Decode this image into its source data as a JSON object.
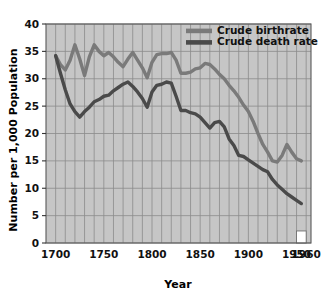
{
  "chart_data": {
    "type": "line",
    "title": "",
    "xlabel": "Year",
    "ylabel": "Number per 1,000 Population",
    "xlim": [
      1690,
      1965
    ],
    "ylim": [
      0,
      40
    ],
    "xticks": [
      1700,
      1750,
      1800,
      1850,
      1900,
      1950,
      1960
    ],
    "xtick_labels": [
      "1700",
      "1750",
      "1800",
      "1850",
      "1900",
      "1950",
      "1960"
    ],
    "yticks": [
      0,
      5,
      10,
      15,
      20,
      25,
      30,
      35,
      40
    ],
    "ytick_labels": [
      "0",
      "5",
      "10",
      "15",
      "20",
      "25",
      "30",
      "35",
      "40"
    ],
    "grid": true,
    "grid_x_step": 10,
    "grid_y_step": 5,
    "legend_position": "top-right",
    "plot_background": "#c6c6c6",
    "grid_color": "#8c8c8c",
    "series": [
      {
        "name": "Crude birthrate",
        "color": "#7a7a7a",
        "x": [
          1700,
          1705,
          1710,
          1715,
          1720,
          1725,
          1730,
          1735,
          1740,
          1745,
          1750,
          1755,
          1760,
          1765,
          1770,
          1775,
          1780,
          1785,
          1790,
          1795,
          1800,
          1805,
          1810,
          1815,
          1820,
          1825,
          1830,
          1835,
          1840,
          1845,
          1850,
          1855,
          1860,
          1865,
          1870,
          1875,
          1880,
          1885,
          1890,
          1895,
          1900,
          1905,
          1910,
          1915,
          1920,
          1925,
          1930,
          1935,
          1940,
          1945,
          1950,
          1955
        ],
        "values": [
          34.2,
          32.6,
          31.6,
          33.4,
          36.2,
          33.6,
          30.6,
          34.0,
          36.2,
          35.0,
          34.2,
          34.8,
          34.0,
          33.0,
          32.2,
          33.6,
          34.8,
          33.4,
          32.0,
          30.2,
          33.0,
          34.4,
          34.6,
          34.6,
          34.8,
          33.4,
          31.0,
          31.0,
          31.2,
          31.8,
          32.0,
          32.8,
          32.6,
          31.8,
          30.8,
          30.0,
          28.8,
          27.8,
          26.6,
          25.2,
          24.0,
          22.2,
          20.0,
          18.0,
          16.6,
          15.0,
          14.8,
          16.0,
          18.0,
          16.6,
          15.4,
          15.0
        ]
      },
      {
        "name": "Crude death rate",
        "color": "#4a4a4a",
        "x": [
          1700,
          1705,
          1710,
          1715,
          1720,
          1725,
          1730,
          1735,
          1740,
          1745,
          1750,
          1755,
          1760,
          1765,
          1770,
          1775,
          1780,
          1785,
          1790,
          1795,
          1800,
          1805,
          1810,
          1815,
          1820,
          1825,
          1830,
          1835,
          1840,
          1845,
          1850,
          1855,
          1860,
          1865,
          1870,
          1875,
          1880,
          1885,
          1890,
          1895,
          1900,
          1905,
          1910,
          1915,
          1920,
          1925,
          1930,
          1935,
          1940,
          1945,
          1950,
          1955
        ],
        "values": [
          34.2,
          31.0,
          28.0,
          25.4,
          24.0,
          23.0,
          24.0,
          24.8,
          25.8,
          26.2,
          26.8,
          27.0,
          27.8,
          28.4,
          29.0,
          29.4,
          28.6,
          27.6,
          26.4,
          24.8,
          27.6,
          28.8,
          29.0,
          29.4,
          29.2,
          26.8,
          24.2,
          24.2,
          23.8,
          23.6,
          23.0,
          22.0,
          21.0,
          22.0,
          22.2,
          21.2,
          19.0,
          17.8,
          16.0,
          15.8,
          15.2,
          14.6,
          14.0,
          13.4,
          13.0,
          11.6,
          10.6,
          9.8,
          9.0,
          8.4,
          7.8,
          7.2
        ]
      }
    ],
    "annotations": [
      {
        "name": "axis-break-notch",
        "type": "rect",
        "x0": 1950,
        "x1": 1960,
        "y0": 0,
        "y1": 2.2,
        "fill": "#ffffff"
      }
    ]
  },
  "legend": {
    "entries": [
      {
        "label": "Crude birthrate",
        "swatch_color": "#7a7a7a"
      },
      {
        "label": "Crude death rate",
        "swatch_color": "#4a4a4a"
      }
    ]
  },
  "axes": {
    "y_title": "Number per 1,000 Population",
    "x_title": "Year"
  }
}
